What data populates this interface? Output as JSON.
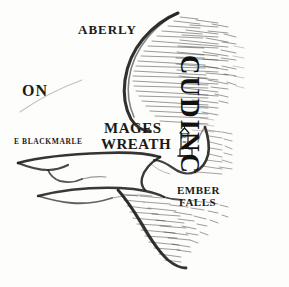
{
  "map": {
    "title": "hand-drawn fantasy map fragment",
    "background_color": "#fdfdfc",
    "ink_color": "#1a1a18",
    "labels": {
      "aberly": "ABERLY",
      "on": "ON",
      "blackmarle": "E BLACKMARLE",
      "mages": "MAGES",
      "wreath": "WREATH",
      "ember": "EMBER",
      "falls": "FALLS",
      "region_vertical": "CUDINC"
    },
    "markers": {
      "tower": "tower-icon"
    },
    "features": {
      "coastline": "coastline-path",
      "rivers": "river-paths",
      "hatching": "water-hatching"
    }
  }
}
